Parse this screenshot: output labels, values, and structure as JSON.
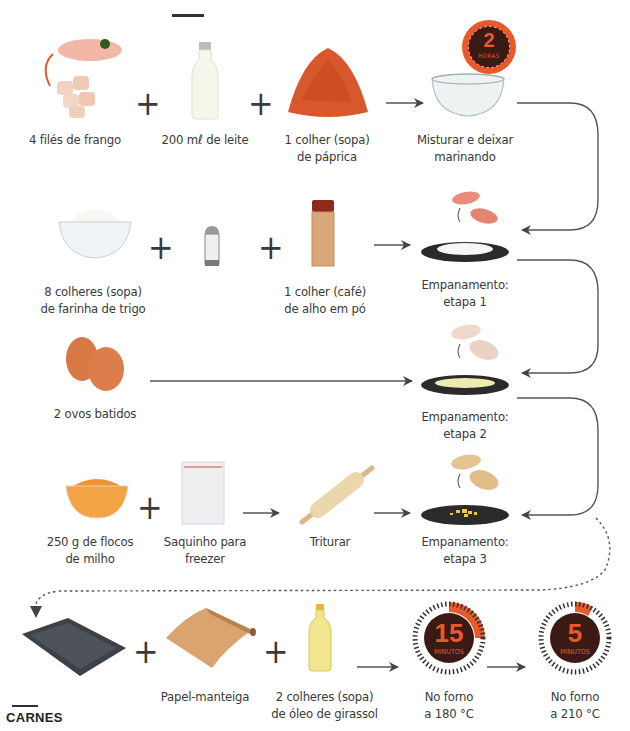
{
  "rows": [
    {
      "items": [
        {
          "icon": "chicken-fillet-icon",
          "label": [
            "4 filés de frango"
          ]
        },
        {
          "icon": "milk-bottle-icon",
          "label": [
            "200 mℓ de leite"
          ]
        },
        {
          "icon": "paprika-powder-icon",
          "label": [
            "1 colher (sopa)",
            "de páprica"
          ]
        }
      ],
      "result": {
        "icon": "glass-bowl-icon",
        "label": [
          "Misturar e deixar",
          "marinando"
        ]
      },
      "timer": {
        "value": "2",
        "unit": "HORAS"
      }
    },
    {
      "items": [
        {
          "icon": "flour-bowl-icon",
          "label": [
            "8 colheres (sopa)",
            "de farinha de trigo"
          ]
        },
        {
          "icon": "salt-shaker-icon",
          "label": []
        },
        {
          "icon": "garlic-powder-jar-icon",
          "label": [
            "1 colher (café)",
            "de alho em pó"
          ]
        }
      ],
      "result": {
        "icon": "flour-plate-icon",
        "label": [
          "Empanamento:",
          "etapa 1"
        ]
      }
    },
    {
      "items": [
        {
          "icon": "eggs-icon",
          "label": [
            "2 ovos batidos"
          ]
        }
      ],
      "result": {
        "icon": "egg-plate-icon",
        "label": [
          "Empanamento:",
          "etapa 2"
        ]
      }
    },
    {
      "items": [
        {
          "icon": "corn-flakes-bowl-icon",
          "label": [
            "250 g de flocos",
            "de milho"
          ]
        },
        {
          "icon": "freezer-bag-icon",
          "label": [
            "Saquinho para",
            "freezer"
          ]
        },
        {
          "icon": "rolling-pin-icon",
          "label": [
            "Triturar"
          ]
        }
      ],
      "result": {
        "icon": "crumbs-plate-icon",
        "label": [
          "Empanamento:",
          "etapa 3"
        ]
      }
    },
    {
      "items": [
        {
          "icon": "baking-tray-icon",
          "label": []
        },
        {
          "icon": "parchment-roll-icon",
          "label": [
            "Papel-manteiga"
          ]
        },
        {
          "icon": "oil-bottle-icon",
          "label": [
            "2 colheres (sopa)",
            "de óleo de girassol"
          ]
        }
      ],
      "timers": [
        {
          "value": "15",
          "unit": "MINUTOS",
          "label": [
            "No forno",
            "a 180 °C"
          ]
        },
        {
          "value": "5",
          "unit": "MINUTOS",
          "label": [
            "No forno",
            "a 210 °C"
          ]
        }
      ]
    }
  ],
  "plus_sign": "+",
  "footer": {
    "section": "CARNES"
  },
  "colors": {
    "accent": "#e8592b",
    "timer_dark": "#3b1a14",
    "line": "#555555"
  }
}
